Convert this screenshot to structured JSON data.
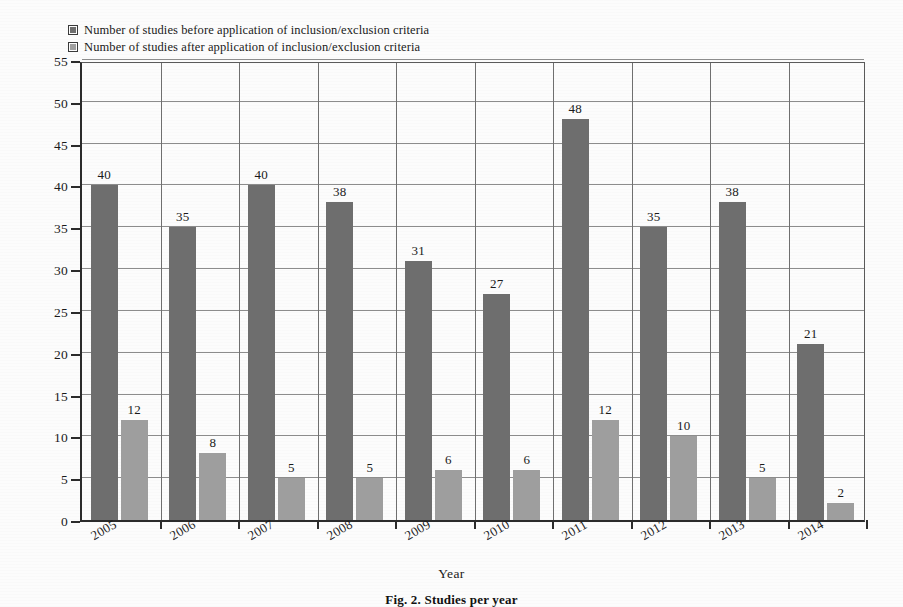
{
  "legend": {
    "position": "top-left",
    "entries": [
      {
        "key": "before",
        "label": "Number of studies before application of inclusion/exclusion criteria",
        "color": "#6e6e6e"
      },
      {
        "key": "after",
        "label": "Number of studies after application of inclusion/exclusion criteria",
        "color": "#9e9e9e"
      }
    ]
  },
  "axes": {
    "y_title": "Number of Studies",
    "x_title": "Year",
    "y_ticks": [
      "0",
      "5",
      "10",
      "15",
      "20",
      "25",
      "30",
      "35",
      "40",
      "45",
      "50",
      "55"
    ]
  },
  "caption": {
    "text": "Fig. 2. Studies per year"
  },
  "chart_data": {
    "type": "bar",
    "title": "",
    "xlabel": "Year",
    "ylabel": "Number of Studies",
    "categories": [
      "2005",
      "2006",
      "2007",
      "2008",
      "2009",
      "2010",
      "2011",
      "2012",
      "2013",
      "2014"
    ],
    "series": [
      {
        "name": "Number of studies before application of inclusion/exclusion criteria",
        "color": "#6e6e6e",
        "values": [
          40,
          35,
          40,
          38,
          31,
          27,
          48,
          35,
          38,
          21
        ]
      },
      {
        "name": "Number of studies after application of inclusion/exclusion criteria",
        "color": "#9e9e9e",
        "values": [
          12,
          8,
          5,
          5,
          6,
          6,
          12,
          10,
          5,
          2
        ]
      }
    ],
    "ylim": [
      0,
      55
    ],
    "ytick_step": 5,
    "grid": "horizontal-and-vertical",
    "legend_position": "top-left",
    "data_labels": true
  }
}
